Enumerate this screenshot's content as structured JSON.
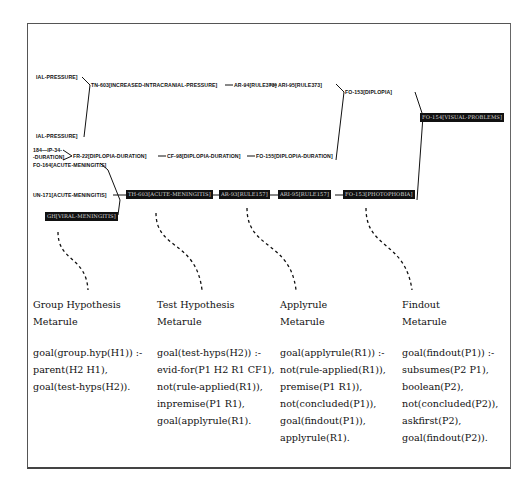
{
  "diagram": {
    "nodes": {
      "top_left_1": "IAL-PRESSURE]",
      "top_left_2": "IAL-PRESSURE]",
      "tn_603": "TN-603[INCREASED-INTRACRANIAL-PRESSURE]",
      "ar_94": "AR-94[RULE373]",
      "ari_95": "ARI-95[RULE373]",
      "fo_153": "FO-153[DIPLOPIA]",
      "black_right": "FO-154[VISUAL-PROBLEMS]",
      "left_mid_1": "184—IP-34-",
      "left_mid_2": "-DURATION]",
      "fr_22": "FR-22[DIPLOPIA-DURATION]",
      "cf_98": "CF-98[DIPLOPIA-DURATION]",
      "fo_155": "FO-155[DIPLOPIA-DURATION]",
      "fo_164": "FO-164[ACUTE-MENINGITIS]",
      "un_171": "UN-171[ACUTE-MENINGITIS]",
      "black_th": "TH-603[ACUTE-MENINGITIS]",
      "black_ar": "AR-93[RULE157]",
      "black_ari": "ARI-95[RULE157]",
      "black_fo": "FO-153[PHOTOPHOBIA]",
      "black_gh": "GH[VIRAL-MENINGITIS]"
    },
    "connectors": [
      "—",
      "—",
      "—",
      "—",
      "—",
      "—"
    ]
  },
  "metarules": [
    {
      "title": [
        "Group Hypothesis",
        "Metarule"
      ],
      "lines": [
        "goal(group.hyp(H1)) :-",
        "parent(H2 H1),",
        "goal(test-hyps(H2))."
      ]
    },
    {
      "title": [
        "Test Hypothesis",
        "Metarule"
      ],
      "lines": [
        "goal(test-hyps(H2)) :-",
        "evid-for(P1 H2 R1 CF1),",
        "not(rule-applied(R1)),",
        "inpremise(P1 R1),",
        "goal(applyrule(R1)."
      ]
    },
    {
      "title": [
        "Applyrule",
        "Metarule"
      ],
      "lines": [
        "goal(applyrule(R1)) :-",
        "not(rule-applied(R1)),",
        "premise(P1 R1)),",
        "not(concluded(P1)),",
        "goal(findout(P1)),",
        "applyrule(R1)."
      ]
    },
    {
      "title": [
        "Findout",
        "Metarule"
      ],
      "lines": [
        "goal(findout(P1)) :-",
        "subsumes(P2 P1),",
        "boolean(P2),",
        "not(concluded(P2)),",
        "askfirst(P2),",
        "goal(findout(P2))."
      ]
    }
  ]
}
